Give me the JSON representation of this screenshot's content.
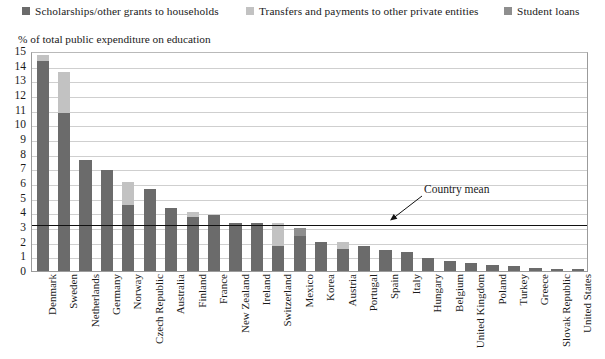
{
  "legend": {
    "items": [
      {
        "label": "Scholarships/other grants to households",
        "color": "#6b6b6b",
        "x": 22
      },
      {
        "label": "Transfers and payments to other private entities",
        "color": "#c2c2c2",
        "x": 246
      },
      {
        "label": "Student loans",
        "color": "#8e8e8e",
        "x": 504
      }
    ]
  },
  "annotation": {
    "country_mean_label": "Country mean"
  },
  "chart_data": {
    "type": "bar",
    "stacked": true,
    "title": "",
    "subtitle": "% of total public expenditure on education",
    "xlabel": "",
    "ylabel": "% of total public expenditure on education",
    "ylim": [
      0,
      15
    ],
    "ytick_step": 1,
    "yticks": [
      "0",
      "1",
      "2",
      "3",
      "4",
      "5",
      "6",
      "7",
      "8",
      "9",
      "10",
      "11",
      "12",
      "13",
      "14",
      "15"
    ],
    "grid": true,
    "legend_position": "top",
    "country_mean": 3.3,
    "categories": [
      "Denmark",
      "Sweden",
      "Netherlands",
      "Germany",
      "Norway",
      "Czech Republic",
      "Australia",
      "Finland",
      "France",
      "New Zealand",
      "Ireland",
      "Switzerland",
      "Mexico",
      "Korea",
      "Austria",
      "Portugal",
      "Spain",
      "Italy",
      "Hungary",
      "Belgium",
      "United Kingdom",
      "Poland",
      "Turkey",
      "Greece",
      "Slovak Republic",
      "United States"
    ],
    "series": [
      {
        "name": "Scholarships/other grants to households",
        "color": "#6b6b6b",
        "values": [
          14.3,
          10.8,
          7.6,
          6.9,
          4.5,
          5.6,
          4.3,
          3.7,
          3.8,
          3.3,
          3.3,
          1.7,
          2.4,
          2.0,
          1.5,
          1.7,
          1.4,
          1.3,
          0.9,
          0.7,
          0.55,
          0.4,
          0.35,
          0.2,
          0.15,
          0.15
        ]
      },
      {
        "name": "Transfers and payments to other private entities",
        "color": "#c2c2c2",
        "values": [
          0.4,
          2.8,
          0.0,
          0.0,
          1.6,
          0.0,
          0.0,
          0.3,
          0.0,
          0.0,
          0.0,
          1.6,
          0.0,
          0.0,
          0.5,
          0.0,
          0.0,
          0.0,
          0.0,
          0.0,
          0.0,
          0.0,
          0.0,
          0.0,
          0.0,
          0.0
        ]
      },
      {
        "name": "Student loans",
        "color": "#8e8e8e",
        "values": [
          0.0,
          0.0,
          0.0,
          0.0,
          0.0,
          0.0,
          0.0,
          0.0,
          0.0,
          0.0,
          0.0,
          0.0,
          0.5,
          0.0,
          0.0,
          0.0,
          0.0,
          0.0,
          0.0,
          0.0,
          0.0,
          0.0,
          0.0,
          0.0,
          0.0,
          0.0
        ]
      }
    ],
    "totals": [
      14.7,
      13.6,
      7.6,
      6.9,
      6.1,
      5.6,
      4.3,
      4.0,
      3.8,
      3.3,
      3.3,
      3.3,
      2.9,
      2.0,
      2.0,
      1.7,
      1.4,
      1.3,
      0.9,
      0.7,
      0.55,
      0.4,
      0.35,
      0.2,
      0.15,
      0.15
    ]
  }
}
